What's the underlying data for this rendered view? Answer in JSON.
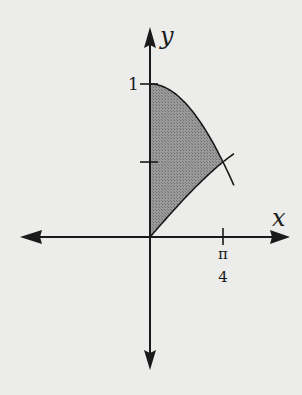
{
  "diagram": {
    "x_axis_label": "x",
    "y_axis_label": "y",
    "y_tick_label": "1",
    "x_tick_label_numerator": "π",
    "x_tick_label_denominator": "4",
    "curves": [
      {
        "name": "cos x",
        "from_x": 0,
        "to_x": 0.785,
        "start_y": 1
      },
      {
        "name": "sin x",
        "from_x": 0,
        "to_x": 0.785,
        "start_y": 0
      }
    ],
    "intersection": {
      "x": "pi/4"
    },
    "colors": {
      "background": "#ececea",
      "fill": "#8a8a8a",
      "stroke": "#1a1a1a"
    }
  }
}
